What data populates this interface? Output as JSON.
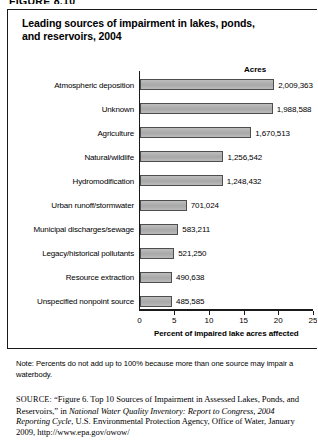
{
  "figure_label": "FIGURE 8.10",
  "chart_title": "Leading sources of impairment in lakes, ponds, and reservoirs, 2004",
  "acres_header": "Acres",
  "note": "Note: Percents do not add up to 100% because more than one source may impair a waterbody.",
  "source": {
    "prefix": "SOURCE:",
    "part1": " “Figure 6. Top 10 Sources of Impairment in Assessed Lakes, Ponds, and Reservoirs,” in ",
    "italic1": "National Water Quality Inventory: Report to Congress, 2004 Reporting Cycle",
    "part2": ", U.S. Environmental Protection Agency, Office of Water, January 2009, http://www.epa.gov/owow/"
  },
  "chart_data": {
    "type": "bar",
    "orientation": "horizontal",
    "title": "Leading sources of impairment in lakes, ponds, and reservoirs, 2004",
    "xlabel": "Percent of impaired lake acres affected",
    "ylabel": "",
    "xlim": [
      0,
      25
    ],
    "xticks": [
      0,
      5,
      10,
      15,
      20,
      25
    ],
    "xtick_labels": [
      "0",
      "5",
      "10",
      "15",
      "20",
      "25"
    ],
    "grid": false,
    "legend": "none",
    "value_axis_units": "percent",
    "data_label_header": "Acres",
    "categories": [
      "Atmospheric deposition",
      "Unknown",
      "Agriculture",
      "Natural/wildlife",
      "Hydromodification",
      "Urban runoff/stormwater",
      "Municipal discharges/sewage",
      "Legacy/historical pollutants",
      "Resource extraction",
      "Unspecified nonpoint source"
    ],
    "values": [
      19.4,
      19.2,
      16.1,
      12.1,
      12.0,
      6.8,
      5.6,
      5.0,
      4.7,
      4.7
    ],
    "acres": [
      2009363,
      1988588,
      1670513,
      1256542,
      1248432,
      701024,
      583211,
      521250,
      490638,
      485585
    ],
    "acres_labels": [
      "2,009,363",
      "1,988,588",
      "1,670,513",
      "1,256,542",
      "1,248,432",
      "701,024",
      "583,211",
      "521,250",
      "490,638",
      "485,585"
    ],
    "bar_color": "#b0b0b0",
    "bar_edge_color": "#4d4d4d"
  }
}
